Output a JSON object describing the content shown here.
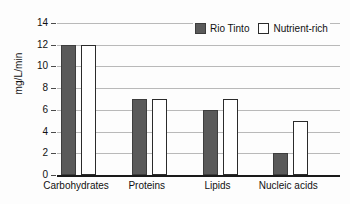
{
  "chart_data": {
    "type": "bar",
    "title": "",
    "xlabel": "",
    "ylabel": "mg/L/min",
    "ylim": [
      0,
      14
    ],
    "ytick_step": 2,
    "yticks": [
      "0",
      "2",
      "4",
      "6",
      "8",
      "10",
      "12",
      "14"
    ],
    "grid": true,
    "legend_position": "top-right",
    "categories": [
      "Carbohydrates",
      "Proteins",
      "Lipids",
      "Nucleic acids"
    ],
    "series": [
      {
        "name": "Rio Tinto",
        "color": "#5a5a5a",
        "values": [
          12,
          7,
          6,
          2
        ]
      },
      {
        "name": "Nutrient-rich",
        "color": "#ffffff",
        "values": [
          12,
          7,
          7,
          5
        ]
      }
    ]
  },
  "legend": {
    "entries": [
      {
        "label": "Rio Tinto",
        "swatch": "filled-dark-square"
      },
      {
        "label": "Nutrient-rich",
        "swatch": "open-white-square"
      }
    ]
  },
  "colors": {
    "series_a_fill": "#5a5a5a",
    "series_a_stroke": "#3d3d3d",
    "series_b_fill": "#ffffff",
    "series_b_stroke": "#2b2b2b",
    "gridline": "#b9b9b9",
    "axis": "#1a1a1a",
    "background": "#fdfdfd",
    "text": "#111111"
  }
}
